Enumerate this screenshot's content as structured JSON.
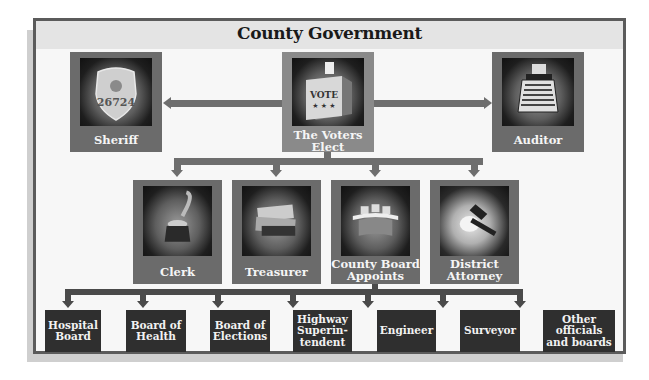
{
  "title": "County Government",
  "elected_top": [
    {
      "label": "Sheriff",
      "icon": "badge-icon",
      "badge_number": "26724"
    },
    {
      "label": "The Voters Elect",
      "icon": "ballot-box-icon",
      "ballot_text": "VOTE"
    },
    {
      "label": "Auditor",
      "icon": "calculator-icon"
    }
  ],
  "elected_middle": [
    {
      "label": "Clerk",
      "icon": "inkwell-quill-icon"
    },
    {
      "label": "Treasurer",
      "icon": "money-icon"
    },
    {
      "label": "County Board Appoints",
      "icon": "board-table-icon"
    },
    {
      "label": "District Attorney",
      "icon": "gavel-icon"
    }
  ],
  "appointed": [
    {
      "label": "Hospital Board"
    },
    {
      "label": "Board of Health"
    },
    {
      "label": "Board of Elections"
    },
    {
      "label": "Highway Superin-tendent"
    },
    {
      "label": "Engineer"
    },
    {
      "label": "Surveyor"
    },
    {
      "label": "Other officials and boards"
    }
  ],
  "colors": {
    "frame": "#5b5b5b",
    "title_bar": "#e4e4e4",
    "box": "#6b6b6b",
    "appointed_box": "#2f2f2f",
    "connector": "#6e6e6e"
  }
}
